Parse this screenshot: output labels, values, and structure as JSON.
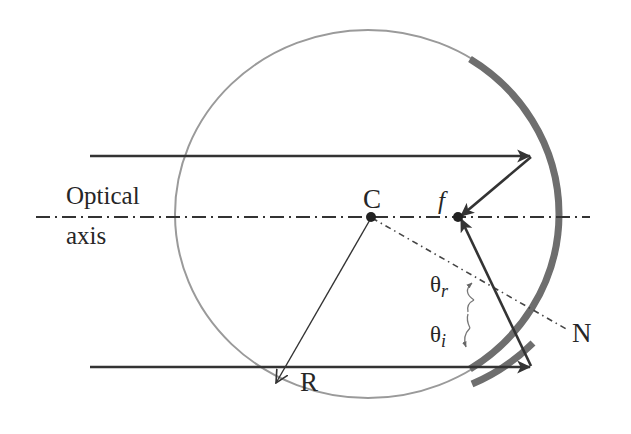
{
  "diagram": {
    "labels": {
      "optical_axis_line1": "Optical",
      "optical_axis_line2": "axis",
      "center": "C",
      "focus": "f",
      "theta_r_base": "θ",
      "theta_r_sub": "r",
      "theta_i_base": "θ",
      "theta_i_sub": "i",
      "normal": "N",
      "radius": "R"
    },
    "colors": {
      "background": "#ffffff",
      "circle": "#9a9a9a",
      "mirror": "#6e6e6e",
      "rays": "#333333",
      "text": "#262626"
    }
  }
}
